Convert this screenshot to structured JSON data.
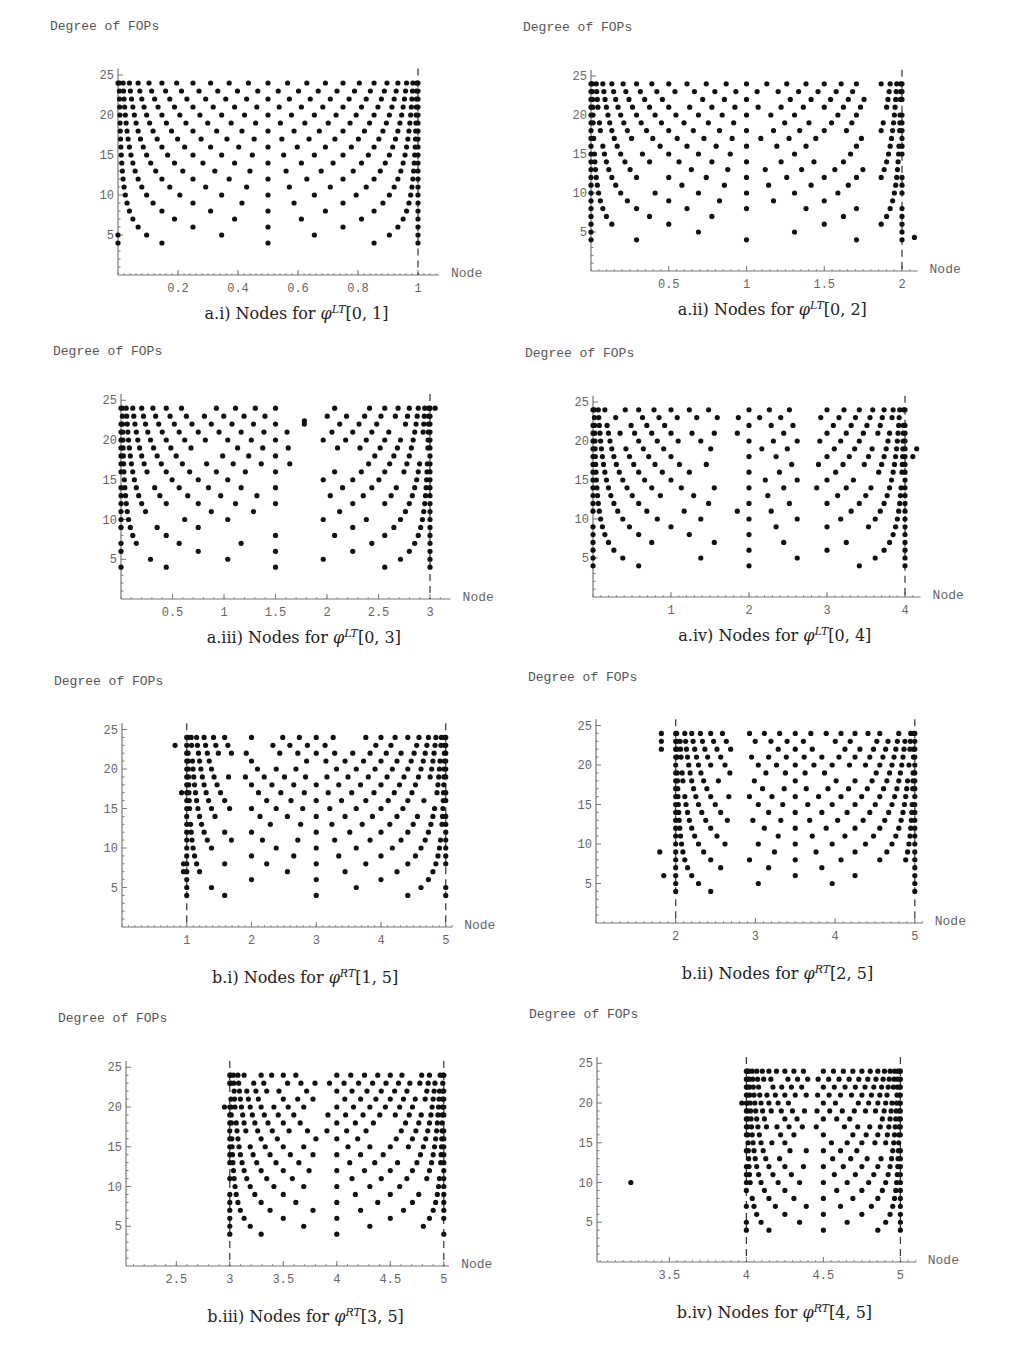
{
  "chart_data": [
    {
      "id": "a_i",
      "type": "scatter",
      "caption_prefix": "a.i) Nodes for ",
      "caption_func": "φ",
      "caption_sup": "LT",
      "caption_interval": "[0, 1]",
      "ylabel": "Degree of FOPs",
      "xlabel": "Node",
      "xlim": [
        0,
        1.07
      ],
      "ylim": [
        0,
        25.5
      ],
      "xticks": [
        0.2,
        0.4,
        0.6,
        0.8,
        1
      ],
      "xtick_labels": [
        "0.2",
        "0.4",
        "0.6",
        "0.8",
        "1"
      ],
      "yticks": [
        5,
        10,
        15,
        20,
        25
      ],
      "dashed_lines_x": [
        1
      ],
      "geom": {
        "ox": 118,
        "oy": 275,
        "x0": 0,
        "sx": 300,
        "sy": 8,
        "xend": 1.07
      },
      "description": "Chebyshev-like node families: for each degree n (4..24) nodes x_k = (1 - cos(k*pi/n))/2 on [0,1]",
      "generator": {
        "kind": "cheb",
        "a": 0,
        "b": 1,
        "nmin": 4,
        "nmax": 24
      },
      "extra_points": []
    },
    {
      "id": "a_ii",
      "type": "scatter",
      "caption_prefix": "a.ii) Nodes for ",
      "caption_func": "φ",
      "caption_sup": "LT",
      "caption_interval": "[0, 2]",
      "ylabel": "Degree of FOPs",
      "xlabel": "Node",
      "xlim": [
        0,
        2.1
      ],
      "ylim": [
        0,
        25.5
      ],
      "xticks": [
        0.5,
        1,
        1.5,
        2
      ],
      "xtick_labels": [
        "0.5",
        "1",
        "1.5",
        "2"
      ],
      "yticks": [
        5,
        10,
        15,
        20,
        25
      ],
      "dashed_lines_x": [
        2
      ],
      "geom": {
        "ox": 591,
        "oy": 271,
        "x0": 0,
        "sx": 155.5,
        "sy": 7.8,
        "xend": 2.1
      },
      "generator": {
        "kind": "cheb_gap",
        "a": 0,
        "b": 2,
        "nmin": 4,
        "nmax": 24,
        "gap": [
          1.76,
          1.86
        ]
      },
      "extra_points": [
        [
          2.08,
          4.3
        ]
      ]
    },
    {
      "id": "a_iii",
      "type": "scatter",
      "caption_prefix": "a.iii) Nodes for ",
      "caption_func": "φ",
      "caption_sup": "LT",
      "caption_interval": "[0, 3]",
      "ylabel": "Degree of FOPs",
      "xlabel": "Node",
      "xlim": [
        0,
        3.2
      ],
      "ylim": [
        0,
        25.5
      ],
      "xticks": [
        0.5,
        1,
        1.5,
        2,
        2.5,
        3
      ],
      "xtick_labels": [
        "0.5",
        "1",
        "1.5",
        "2",
        "2.5",
        "3"
      ],
      "yticks": [
        5,
        10,
        15,
        20,
        25
      ],
      "dashed_lines_x": [
        3
      ],
      "geom": {
        "ox": 121,
        "oy": 599,
        "x0": 0,
        "sx": 103,
        "sy": 7.95,
        "xend": 3.2
      },
      "generator": {
        "kind": "cheb_gap",
        "a": 0,
        "b": 3,
        "nmin": 4,
        "nmax": 24,
        "gap": [
          1.65,
          1.93
        ]
      },
      "extra_points": [
        [
          1.78,
          22
        ],
        [
          1.78,
          22.4
        ],
        [
          3.05,
          24
        ]
      ]
    },
    {
      "id": "a_iv",
      "type": "scatter",
      "caption_prefix": "a.iv) Nodes for ",
      "caption_func": "φ",
      "caption_sup": "LT",
      "caption_interval": "[0, 4]",
      "ylabel": "Degree of FOPs",
      "xlabel": "Node",
      "xlim": [
        0,
        4.2
      ],
      "ylim": [
        0,
        25.5
      ],
      "xticks": [
        1,
        2,
        3,
        4
      ],
      "xtick_labels": [
        "1",
        "2",
        "3",
        "4"
      ],
      "yticks": [
        5,
        10,
        15,
        20,
        25
      ],
      "dashed_lines_x": [
        4
      ],
      "geom": {
        "ox": 593,
        "oy": 597,
        "x0": 0,
        "sx": 78,
        "sy": 7.8,
        "xend": 4.2
      },
      "generator": {
        "kind": "cheb_gap2",
        "a": 0,
        "b": 4,
        "nmin": 4,
        "nmax": 24,
        "gaps": [
          [
            1.6,
            1.85
          ],
          [
            2.65,
            2.85
          ]
        ]
      },
      "extra_points": [
        [
          1.85,
          11
        ],
        [
          4.1,
          18
        ],
        [
          4.15,
          19
        ]
      ]
    },
    {
      "id": "b_i",
      "type": "scatter",
      "caption_prefix": "b.i) Nodes for ",
      "caption_func": "φ",
      "caption_sup": "RT",
      "caption_interval": "[1, 5]",
      "ylabel": "Degree of FOPs",
      "xlabel": "Node",
      "xlim": [
        0,
        5.1
      ],
      "ylim": [
        0,
        25.5
      ],
      "xticks": [
        1,
        2,
        3,
        4,
        5
      ],
      "xtick_labels": [
        "1",
        "2",
        "3",
        "4",
        "5"
      ],
      "yticks": [
        5,
        10,
        15,
        20,
        25
      ],
      "dashed_lines_x": [
        1,
        5
      ],
      "geom": {
        "ox": 122,
        "oy": 927,
        "x0": 0,
        "sx": 64.75,
        "sy": 7.9,
        "xend": 5.1
      },
      "generator": {
        "kind": "cheb_rt",
        "a": 1,
        "b": 5,
        "nmin": 4,
        "nmax": 24,
        "gap": [
          1.7,
          1.9
        ]
      },
      "extra_points": [
        [
          0.82,
          23
        ],
        [
          0.92,
          17
        ],
        [
          0.95,
          8
        ],
        [
          0.95,
          7
        ]
      ]
    },
    {
      "id": "b_ii",
      "type": "scatter",
      "caption_prefix": "b.ii) Nodes for ",
      "caption_func": "φ",
      "caption_sup": "RT",
      "caption_interval": "[2, 5]",
      "ylabel": "Degree of FOPs",
      "xlabel": "Node",
      "xlim": [
        1,
        5.1
      ],
      "ylim": [
        0,
        25.5
      ],
      "xticks": [
        2,
        3,
        4,
        5
      ],
      "xtick_labels": [
        "2",
        "3",
        "4",
        "5"
      ],
      "yticks": [
        5,
        10,
        15,
        20,
        25
      ],
      "dashed_lines_x": [
        2,
        5
      ],
      "geom": {
        "ox": 596,
        "oy": 923,
        "x0": 1,
        "sx": 79.7,
        "sy": 7.9,
        "xend": 5.1
      },
      "generator": {
        "kind": "cheb_rt",
        "a": 2,
        "b": 5,
        "nmin": 4,
        "nmax": 24,
        "gap": [
          2.7,
          2.9
        ]
      },
      "extra_points": [
        [
          1.82,
          24
        ],
        [
          1.82,
          23
        ],
        [
          1.82,
          22
        ],
        [
          1.8,
          9
        ],
        [
          1.85,
          6
        ]
      ]
    },
    {
      "id": "b_iii",
      "type": "scatter",
      "caption_prefix": "b.iii) Nodes for ",
      "caption_func": "φ",
      "caption_sup": "RT",
      "caption_interval": "[3, 5]",
      "ylabel": "Degree of FOPs",
      "xlabel": "Node",
      "xlim": [
        2.03,
        5.05
      ],
      "ylim": [
        0,
        25.5
      ],
      "xticks": [
        2.5,
        3,
        3.5,
        4,
        4.5,
        5
      ],
      "xtick_labels": [
        "2.5",
        "3",
        "3.5",
        "4",
        "4.5",
        "5"
      ],
      "yticks": [
        5,
        10,
        15,
        20,
        25
      ],
      "dashed_lines_x": [
        3,
        5
      ],
      "geom": {
        "ox": 126,
        "oy": 1266,
        "x0": 2.03,
        "sx": 107,
        "sy": 7.95,
        "xend": 5.05
      },
      "generator": {
        "kind": "cheb_rt",
        "a": 3,
        "b": 5,
        "nmin": 4,
        "nmax": 24,
        "gap": [
          3.82,
          3.9
        ]
      },
      "extra_points": [
        [
          2.95,
          20
        ]
      ]
    },
    {
      "id": "b_iv",
      "type": "scatter",
      "caption_prefix": "b.iv) Nodes for ",
      "caption_func": "φ",
      "caption_sup": "RT",
      "caption_interval": "[4, 5]",
      "ylabel": "Degree of FOPs",
      "xlabel": "Node",
      "xlim": [
        3.03,
        5.1
      ],
      "ylim": [
        0,
        25.5
      ],
      "xticks": [
        3.5,
        4,
        4.5,
        5
      ],
      "xtick_labels": [
        "3.5",
        "4",
        "4.5",
        "5"
      ],
      "yticks": [
        5,
        10,
        15,
        20,
        25
      ],
      "dashed_lines_x": [
        4,
        5
      ],
      "geom": {
        "ox": 597,
        "oy": 1262,
        "x0": 3.03,
        "sx": 154,
        "sy": 7.95,
        "xend": 5.1
      },
      "generator": {
        "kind": "cheb_rt",
        "a": 4,
        "b": 5,
        "nmin": 4,
        "nmax": 24,
        "gap": [
          4.4,
          4.45
        ]
      },
      "extra_points": [
        [
          3.25,
          10
        ],
        [
          3.97,
          20
        ]
      ]
    }
  ],
  "colors": {
    "dot": "#111111",
    "axis": "#777777",
    "dashed": "#333333",
    "text": "#666666",
    "caption": "#222222"
  }
}
